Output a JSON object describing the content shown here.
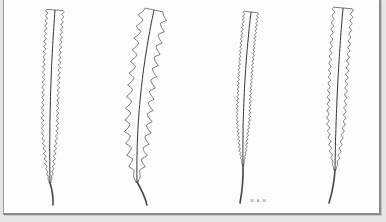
{
  "figure": {
    "signature": "W.A.M.",
    "leaves": [
      {
        "id": "leaf-1",
        "margin": "finely serrate"
      },
      {
        "id": "leaf-2",
        "margin": "coarsely dentate"
      },
      {
        "id": "leaf-3",
        "margin": "finely serrulate"
      },
      {
        "id": "leaf-4",
        "margin": "crenate-serrate"
      }
    ]
  },
  "colors": {
    "paper": "#fdfdfd",
    "ink": "#444444",
    "border": "#8a8a8a"
  }
}
